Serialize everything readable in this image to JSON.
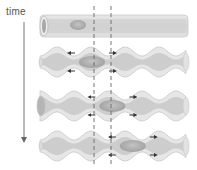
{
  "diagram": {
    "time_label": "time",
    "colors": {
      "outer_wall": "#e4e4e4",
      "outer_wall_stroke": "#c9c9c9",
      "lumen": "#cfcfcf",
      "bolus": "#b3b3b3",
      "arrow": "#333333",
      "dashed_line": "#666666",
      "time_axis": "#777777"
    },
    "rows": [
      {
        "name": "relaxed-tube",
        "bolus_segment": 1
      },
      {
        "name": "contraction-stage-1",
        "bolus_segment": 1
      },
      {
        "name": "contraction-stage-2",
        "bolus_segment": 1.6
      },
      {
        "name": "contraction-stage-3",
        "bolus_segment": 2.2
      }
    ],
    "reference_lines": 2
  }
}
